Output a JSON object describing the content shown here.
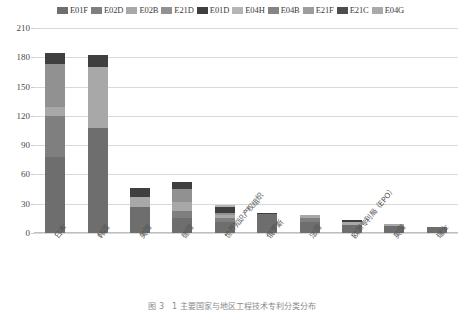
{
  "chart_data": {
    "type": "bar",
    "subtype": "stacked-column",
    "title": "",
    "xlabel": "",
    "ylabel": "",
    "ylim": [
      0,
      210
    ],
    "yticks": [
      0,
      30,
      60,
      90,
      120,
      150,
      180,
      210
    ],
    "grid": true,
    "legend_position": "top",
    "categories": [
      "日本",
      "韩国",
      "美国",
      "德国",
      "世界知识产权组织",
      "俄罗斯",
      "法国",
      "欧洲专利局（EPO）",
      "英国",
      "瑞士"
    ],
    "series": [
      {
        "name": "E01F",
        "color": "#6e6e6e",
        "values": [
          78,
          108,
          27,
          15,
          11,
          19,
          11,
          8,
          7,
          6
        ]
      },
      {
        "name": "E02D",
        "color": "#7f7f7f",
        "values": [
          42,
          0,
          0,
          8,
          4,
          0,
          4,
          0,
          0,
          0
        ]
      },
      {
        "name": "E02B",
        "color": "#a8a8a8",
        "values": [
          9,
          62,
          10,
          9,
          3,
          0,
          3,
          3,
          2,
          0
        ]
      },
      {
        "name": "E21D",
        "color": "#919191",
        "values": [
          44,
          0,
          0,
          13,
          3,
          0,
          0,
          0,
          0,
          0
        ]
      },
      {
        "name": "E01D",
        "color": "#3f3f3f",
        "values": [
          11,
          12,
          9,
          7,
          6,
          2,
          0,
          2,
          0,
          0
        ]
      },
      {
        "name": "E04H",
        "color": "#b5b5b5",
        "values": [
          0,
          0,
          0,
          0,
          2,
          0,
          0,
          0,
          0,
          0
        ]
      },
      {
        "name": "E04B",
        "color": "#858585",
        "values": [
          0,
          0,
          0,
          0,
          0,
          0,
          0,
          0,
          0,
          0
        ]
      },
      {
        "name": "E21F",
        "color": "#9c9c9c",
        "values": [
          0,
          0,
          0,
          0,
          0,
          0,
          0,
          0,
          0,
          0
        ]
      },
      {
        "name": "E21C",
        "color": "#4d4d4d",
        "values": [
          0,
          0,
          0,
          0,
          0,
          0,
          0,
          0,
          0,
          0
        ]
      },
      {
        "name": "E04G",
        "color": "#aaaaaa",
        "values": [
          0,
          0,
          0,
          0,
          0,
          0,
          0,
          0,
          0,
          0
        ]
      }
    ],
    "totals": [
      184,
      182,
      46,
      52,
      29,
      21,
      18,
      13,
      9,
      6
    ]
  },
  "legend": {
    "items": [
      {
        "label": "E01F",
        "color": "#6e6e6e"
      },
      {
        "label": "E02D",
        "color": "#7f7f7f"
      },
      {
        "label": "E02B",
        "color": "#a8a8a8"
      },
      {
        "label": "E21D",
        "color": "#919191"
      },
      {
        "label": "E01D",
        "color": "#3f3f3f"
      },
      {
        "label": "E04H",
        "color": "#b5b5b5"
      },
      {
        "label": "E04B",
        "color": "#858585"
      },
      {
        "label": "E21F",
        "color": "#9c9c9c"
      },
      {
        "label": "E21C",
        "color": "#4d4d4d"
      },
      {
        "label": "E04G",
        "color": "#aaaaaa"
      }
    ]
  },
  "caption": {
    "text": "图 3　1 主要国家与地区工程技术专利分类分布"
  }
}
